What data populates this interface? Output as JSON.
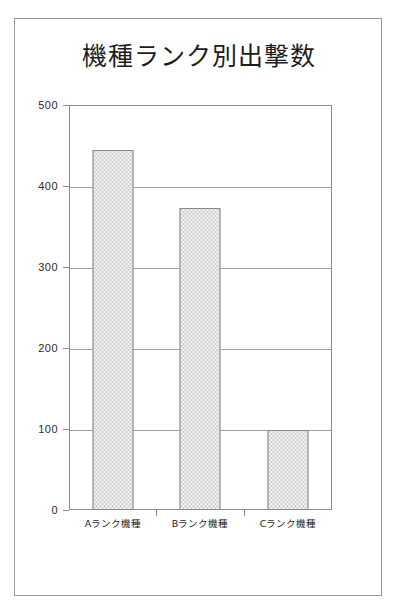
{
  "chart_data": {
    "type": "bar",
    "title": "機種ランク別出撃数",
    "xlabel": "",
    "ylabel": "",
    "categories": [
      "Aランク機種",
      "Bランク機種",
      "Cランク機種"
    ],
    "values": [
      445,
      373,
      99
    ],
    "ylim": [
      0,
      500
    ],
    "y_ticks": [
      "0",
      "100",
      "200",
      "300",
      "400",
      "500"
    ],
    "y_tick_values": [
      0,
      100,
      200,
      300,
      400,
      500
    ],
    "grid": true,
    "legend": "none",
    "bar_fill_color": "#cfcfcf",
    "bar_border_color": "#8a8a8a",
    "axis_color": "#8d8d8d",
    "grid_color": "#9f9f9f",
    "background_color": "#ffffff",
    "text_color": "#1d1d1d"
  }
}
